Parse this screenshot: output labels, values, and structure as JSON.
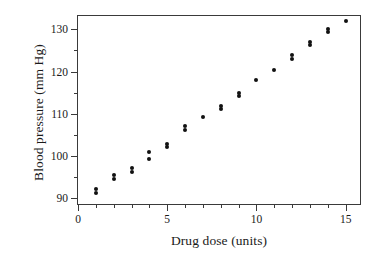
{
  "chart_data": {
    "type": "scatter",
    "title": "",
    "xlabel": "Drug dose (units)",
    "ylabel": "Blood pressure (mm Hg)",
    "xlim": [
      0,
      15.8
    ],
    "ylim": [
      88.5,
      133.2
    ],
    "xticks": [
      0,
      5,
      10,
      15
    ],
    "xtick_labels": [
      "0",
      "5",
      "10",
      "15"
    ],
    "xminor_ticks": [
      1,
      2,
      3,
      4,
      6,
      7,
      8,
      9,
      11,
      12,
      13,
      14
    ],
    "yticks": [
      90,
      100,
      110,
      120,
      130
    ],
    "ytick_labels": [
      "90",
      "100",
      "110",
      "120",
      "130"
    ],
    "yminor_ticks": [
      95,
      105,
      115,
      125
    ],
    "grid": false,
    "legend": null,
    "marker": "filled-circle",
    "marker_color": "#111111",
    "frame_color": "#3a3a3a",
    "background": "#ffffff",
    "points": [
      {
        "x": 1,
        "y": 91.2
      },
      {
        "x": 1,
        "y": 92.0
      },
      {
        "x": 2,
        "y": 94.4
      },
      {
        "x": 2,
        "y": 95.3
      },
      {
        "x": 3,
        "y": 96.2
      },
      {
        "x": 3,
        "y": 97.0
      },
      {
        "x": 4,
        "y": 99.1
      },
      {
        "x": 4,
        "y": 100.9
      },
      {
        "x": 5,
        "y": 102.0
      },
      {
        "x": 5,
        "y": 102.7
      },
      {
        "x": 6,
        "y": 106.2
      },
      {
        "x": 6,
        "y": 107.0
      },
      {
        "x": 7,
        "y": 109.2
      },
      {
        "x": 8,
        "y": 111.2
      },
      {
        "x": 8,
        "y": 111.9
      },
      {
        "x": 9,
        "y": 114.2
      },
      {
        "x": 9,
        "y": 115.0
      },
      {
        "x": 10,
        "y": 118.0
      },
      {
        "x": 11,
        "y": 120.3
      },
      {
        "x": 12,
        "y": 123.0
      },
      {
        "x": 12,
        "y": 123.9
      },
      {
        "x": 13,
        "y": 126.2
      },
      {
        "x": 13,
        "y": 126.9
      },
      {
        "x": 14,
        "y": 129.5
      },
      {
        "x": 14,
        "y": 130.1
      },
      {
        "x": 15,
        "y": 132.0
      }
    ]
  }
}
